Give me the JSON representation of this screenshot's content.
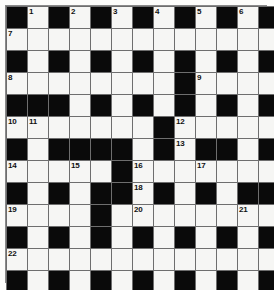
{
  "puzzle": {
    "title": "Crossword Grid",
    "rows": 13,
    "cols": 13,
    "colors": {
      "block": "#0a0a0a",
      "open": "#f6f6f4",
      "gridline": "#6e6e6e",
      "page": "#ffffff",
      "number_text": "#111111"
    },
    "legend": {
      "black_symbol": "#",
      "white_symbol": "."
    },
    "layout": [
      "#.#.#.#.#.#.#",
      ".............",
      "#.#.#.#.#.#.#",
      "........#....",
      "###.#.#.#.#.#",
      ".......#.....",
      "#.####.#.##.#",
      ".....#.......",
      "#.#.##.#.#.##",
      "....#........",
      "#.#.#.#.#.#.#",
      ".............",
      "#.#.#.#.#.#.#"
    ],
    "numbers": [
      {
        "n": 1,
        "row": 0,
        "col": 1
      },
      {
        "n": 2,
        "row": 0,
        "col": 3
      },
      {
        "n": 3,
        "row": 0,
        "col": 5
      },
      {
        "n": 4,
        "row": 0,
        "col": 7
      },
      {
        "n": 5,
        "row": 0,
        "col": 9
      },
      {
        "n": 6,
        "row": 0,
        "col": 11
      },
      {
        "n": 7,
        "row": 1,
        "col": 0
      },
      {
        "n": 8,
        "row": 3,
        "col": 0
      },
      {
        "n": 9,
        "row": 3,
        "col": 9
      },
      {
        "n": 10,
        "row": 5,
        "col": 0
      },
      {
        "n": 11,
        "row": 5,
        "col": 1
      },
      {
        "n": 12,
        "row": 5,
        "col": 8
      },
      {
        "n": 13,
        "row": 6,
        "col": 8
      },
      {
        "n": 14,
        "row": 7,
        "col": 0
      },
      {
        "n": 15,
        "row": 7,
        "col": 3
      },
      {
        "n": 16,
        "row": 7,
        "col": 6
      },
      {
        "n": 17,
        "row": 7,
        "col": 9
      },
      {
        "n": 18,
        "row": 8,
        "col": 6
      },
      {
        "n": 19,
        "row": 9,
        "col": 0
      },
      {
        "n": 20,
        "row": 9,
        "col": 6
      },
      {
        "n": 21,
        "row": 9,
        "col": 11
      },
      {
        "n": 22,
        "row": 11,
        "col": 0
      }
    ],
    "entries": []
  }
}
